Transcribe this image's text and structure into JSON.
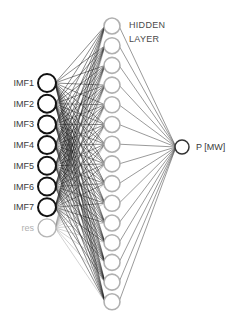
{
  "diagram": {
    "input_layer": {
      "nodes": [
        {
          "label": "IMF1",
          "style": "active"
        },
        {
          "label": "IMF2",
          "style": "active"
        },
        {
          "label": "IMF3",
          "style": "active"
        },
        {
          "label": "IMF4",
          "style": "active"
        },
        {
          "label": "IMF5",
          "style": "active"
        },
        {
          "label": "IMF6",
          "style": "active"
        },
        {
          "label": "IMF7",
          "style": "active"
        },
        {
          "label": "res",
          "style": "faded"
        }
      ]
    },
    "hidden_layer": {
      "label_line1": "HIDDEN",
      "label_line2": "LAYER",
      "node_count": 15
    },
    "output_layer": {
      "label": "P [MW]"
    },
    "colors": {
      "active_node": "#111111",
      "faded_node": "#b5b5b5",
      "hidden_node": "#b0b0b0",
      "output_node": "#333333",
      "active_edge": "#1a1a1a",
      "faded_edge": "#8a8a8a",
      "hidden_to_output_edge": "#555555"
    }
  }
}
